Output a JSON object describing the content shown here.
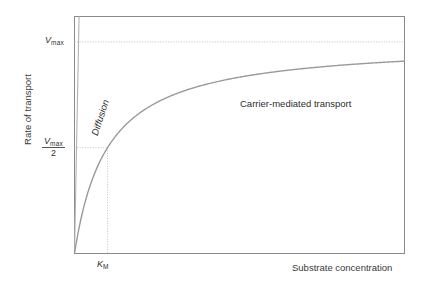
{
  "chart_data": {
    "type": "line",
    "title": "",
    "xlabel": "Substrate concentration",
    "ylabel": "Rate of transport",
    "xlim": [
      0,
      10
    ],
    "ylim": [
      0,
      1.12
    ],
    "grid": false,
    "legend_position": "inline-annotations",
    "axis_tick_labels": {
      "y": [
        "Vmax",
        "Vmax/2"
      ],
      "x": [
        "KM"
      ]
    },
    "reference_lines": [
      {
        "name": "vmax-asymptote",
        "orientation": "horizontal",
        "value": 1.0,
        "label": "Vmax",
        "style": "dotted"
      },
      {
        "name": "half-vmax",
        "orientation": "horizontal",
        "value": 0.5,
        "label": "Vmax/2",
        "style": "dotted"
      },
      {
        "name": "km",
        "orientation": "vertical",
        "value": 1.0,
        "label": "KM",
        "style": "dotted"
      }
    ],
    "series": [
      {
        "name": "Carrier-mediated transport",
        "kind": "michaelis-menten",
        "vmax": 1.0,
        "km": 1.0,
        "color": "#9a9a9a",
        "x": [
          0,
          0.25,
          0.5,
          0.75,
          1.0,
          1.5,
          2.0,
          2.5,
          3.0,
          4.0,
          5.0,
          6.0,
          7.0,
          8.0,
          9.0,
          10.0
        ],
        "values": [
          0,
          0.2,
          0.333,
          0.429,
          0.5,
          0.6,
          0.667,
          0.714,
          0.75,
          0.8,
          0.833,
          0.857,
          0.875,
          0.889,
          0.9,
          0.909
        ]
      },
      {
        "name": "Diffusion",
        "kind": "linear",
        "slope": 8.1,
        "color": "#b2b2b2",
        "x": [
          0,
          1.0
        ],
        "values": [
          0,
          8.1
        ]
      }
    ],
    "annotations": [
      {
        "name": "carrier-mediated-transport-label",
        "text": "Carrier-mediated transport",
        "x": 5.9,
        "y": 0.82
      },
      {
        "name": "diffusion-label",
        "text": "Diffusion",
        "x": 0.45,
        "y": 0.62,
        "rotation": -72
      }
    ]
  },
  "axes": {
    "y_title": "Rate of transport",
    "x_title": "Substrate concentration"
  },
  "labels": {
    "vmax_symbol": "V",
    "vmax_sub": "max",
    "half_denominator": "2",
    "km_symbol": "K",
    "km_sub": "M",
    "curve_label": "Carrier-mediated transport",
    "diffusion_label": "Diffusion"
  },
  "colors": {
    "frame": "#8a8a8a",
    "curve": "#9a9a9a",
    "diffusion": "#b4b4b4",
    "dotted": "#c2c2c2",
    "text": "#2e2e2e"
  }
}
